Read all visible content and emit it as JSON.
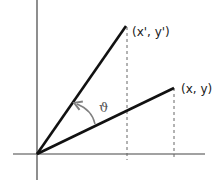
{
  "diagram": {
    "points": {
      "rotated": {
        "label": "(x', y')"
      },
      "original": {
        "label": "(x, y)"
      }
    },
    "angle_label": "ϑ",
    "colors": {
      "axes": "#444444",
      "vectors": "#111111",
      "dashed": "#666666",
      "arc": "#808080"
    }
  }
}
